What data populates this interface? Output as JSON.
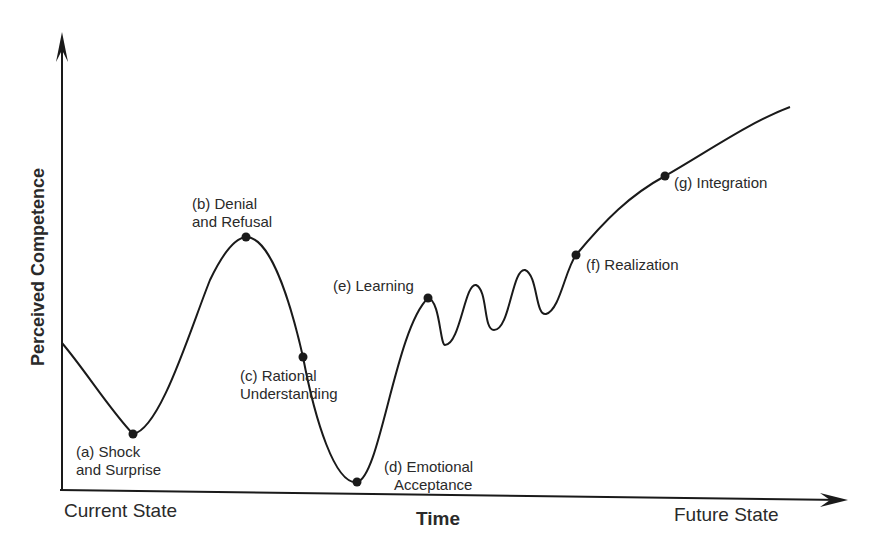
{
  "diagram": {
    "y_axis_label": "Perceived Competence",
    "x_axis_label": "Time",
    "x_axis_start_label": "Current State",
    "x_axis_end_label": "Future State",
    "stages": [
      {
        "id": "a",
        "line1": "(a)  Shock",
        "line2": "and Surprise"
      },
      {
        "id": "b",
        "line1": "(b)  Denial",
        "line2": "and Refusal"
      },
      {
        "id": "c",
        "line1": "(c)  Rational",
        "line2": "Understanding"
      },
      {
        "id": "d",
        "line1": "(d)  Emotional",
        "line2": "Acceptance"
      },
      {
        "id": "e",
        "line1": "(e)  Learning",
        "line2": ""
      },
      {
        "id": "f",
        "line1": "(f)  Realization",
        "line2": ""
      },
      {
        "id": "g",
        "line1": "(g)  Integration",
        "line2": ""
      }
    ],
    "colors": {
      "line": "#1a1a1a",
      "text": "#2a2a2a",
      "background": "#ffffff"
    }
  }
}
